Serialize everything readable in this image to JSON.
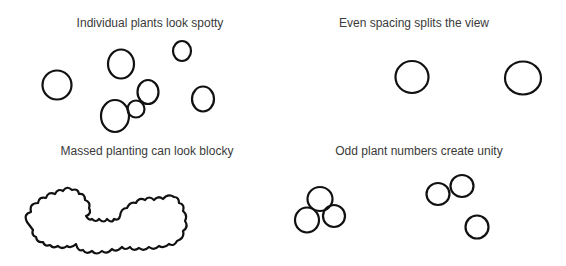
{
  "panels": [
    {
      "id": "spotty",
      "caption": "Individual plants look spotty",
      "plant_count": 7
    },
    {
      "id": "even",
      "caption": "Even spacing splits the view",
      "plant_count": 2
    },
    {
      "id": "massed",
      "caption": "Massed planting can look blocky",
      "plant_count": 1
    },
    {
      "id": "odd",
      "caption": "Odd plant numbers create unity",
      "plant_count": 6
    }
  ]
}
